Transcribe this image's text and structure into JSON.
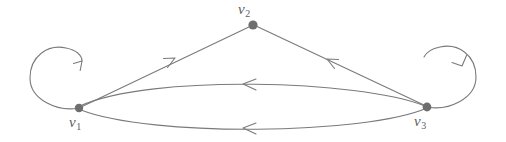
{
  "diagram": {
    "kind": "directed-graph",
    "title": "",
    "canvas": {
      "width": 506,
      "height": 142,
      "background": "#ffffff"
    },
    "style": {
      "edge_color": "#7a7a7a",
      "node_color": "#6e6e6e",
      "label_color": "#5c5c5c",
      "edge_width": 1.1,
      "node_radius": 4.2
    },
    "vertices": [
      {
        "id": "v1",
        "label": "v",
        "subscript": "1",
        "x": 79,
        "y": 108,
        "label_x": 69,
        "label_y": 115
      },
      {
        "id": "v2",
        "label": "v",
        "subscript": "2",
        "x": 253,
        "y": 25,
        "label_x": 238,
        "label_y": 2
      },
      {
        "id": "v3",
        "label": "v",
        "subscript": "3",
        "x": 427,
        "y": 107,
        "label_x": 414,
        "label_y": 114
      }
    ],
    "edges": [
      {
        "id": "e1",
        "from": "v1",
        "to": "v1",
        "type": "self-loop",
        "side": "left",
        "direction": "counterclockwise",
        "arrow_at": "top-right"
      },
      {
        "id": "e2",
        "from": "v3",
        "to": "v3",
        "type": "self-loop",
        "side": "right",
        "direction": "clockwise",
        "arrow_at": "top-right"
      },
      {
        "id": "e3",
        "from": "v1",
        "to": "v2",
        "type": "straight",
        "arrow_at": "midpoint",
        "arrow_direction": "up-right"
      },
      {
        "id": "e4",
        "from": "v3",
        "to": "v2",
        "type": "straight",
        "arrow_at": "midpoint",
        "arrow_direction": "up-left"
      },
      {
        "id": "e5",
        "from": "v3",
        "to": "v1",
        "type": "curve-upper",
        "arrow_at": "midpoint",
        "arrow_direction": "left"
      },
      {
        "id": "e6",
        "from": "v3",
        "to": "v1",
        "type": "curve-lower",
        "arrow_at": "midpoint",
        "arrow_direction": "left"
      }
    ]
  }
}
